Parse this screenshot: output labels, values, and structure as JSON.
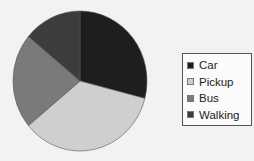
{
  "chart_data": {
    "type": "pie",
    "title": "",
    "categories": [
      "Car",
      "Pickup",
      "Bus",
      "Walking"
    ],
    "values": [
      29,
      35,
      22,
      14
    ],
    "colors": [
      "#1e1e1e",
      "#cfcfcf",
      "#7a7a7a",
      "#3c3c3c"
    ],
    "start_angle_deg": 0,
    "direction": "clockwise",
    "legend_position": "right",
    "legend": [
      "Car",
      "Pickup",
      "Bus",
      "Walking"
    ]
  },
  "legend": {
    "items": [
      {
        "label": "Car",
        "color": "#1e1e1e"
      },
      {
        "label": "Pickup",
        "color": "#cfcfcf"
      },
      {
        "label": "Bus",
        "color": "#7a7a7a"
      },
      {
        "label": "Walking",
        "color": "#3c3c3c"
      }
    ]
  }
}
